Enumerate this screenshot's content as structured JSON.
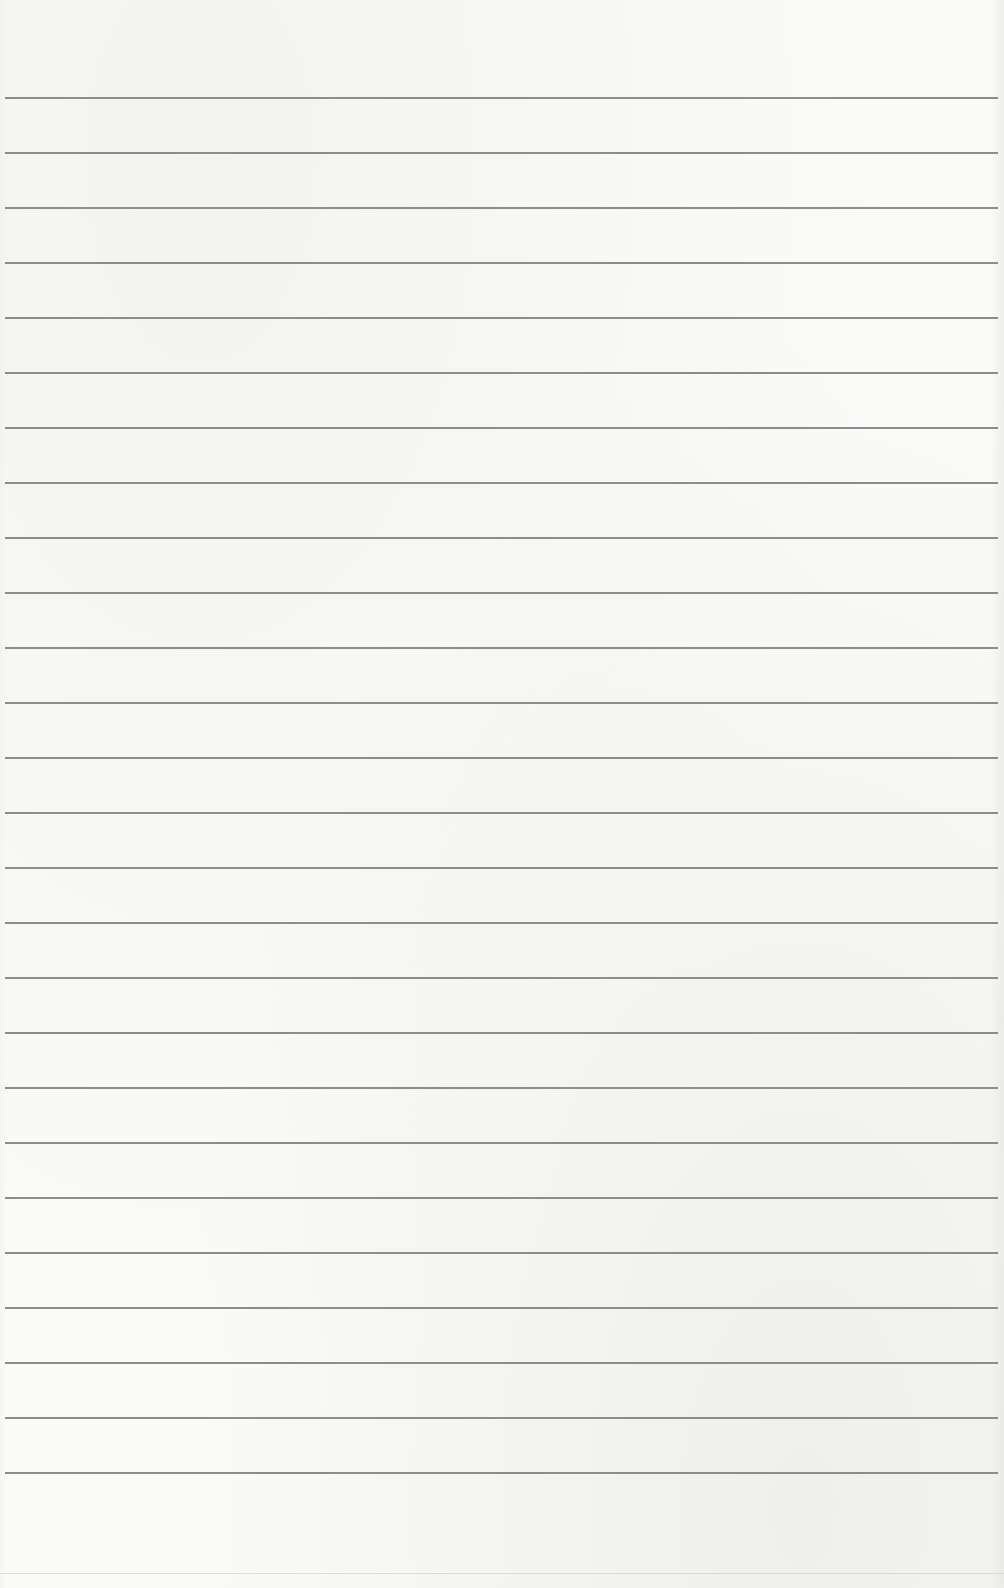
{
  "page": {
    "type": "blank lined paper",
    "background_color": "#fafaf9",
    "line_color": "#8c8c8c",
    "line_count": 26,
    "line_left_px": 5,
    "line_width_px": 993,
    "first_line_top_px": 97,
    "line_spacing_px": 55
  },
  "lines": [
    {
      "top": 97
    },
    {
      "top": 152
    },
    {
      "top": 207
    },
    {
      "top": 262
    },
    {
      "top": 317
    },
    {
      "top": 372
    },
    {
      "top": 427
    },
    {
      "top": 482
    },
    {
      "top": 537
    },
    {
      "top": 592
    },
    {
      "top": 647
    },
    {
      "top": 702
    },
    {
      "top": 757
    },
    {
      "top": 812
    },
    {
      "top": 867
    },
    {
      "top": 922
    },
    {
      "top": 977
    },
    {
      "top": 1032
    },
    {
      "top": 1087
    },
    {
      "top": 1142
    },
    {
      "top": 1197
    },
    {
      "top": 1252
    },
    {
      "top": 1307
    },
    {
      "top": 1362
    },
    {
      "top": 1417
    },
    {
      "top": 1472
    }
  ]
}
